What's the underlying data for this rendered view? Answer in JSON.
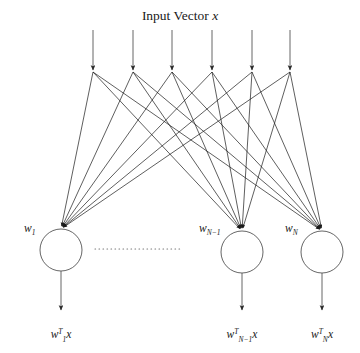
{
  "figure": {
    "title_prefix": "Input Vector ",
    "title_var": "x",
    "width": 360,
    "height": 353,
    "background": "#ffffff",
    "ink_color": "#1a1a1a",
    "line_color": "#555555",
    "dot_color": "#777777"
  },
  "inputs": {
    "count": 6,
    "arrow_x": [
      93,
      133,
      172,
      212,
      252,
      290
    ],
    "arrow_top_y": 30,
    "arrow_tip_y": 70
  },
  "neurons": [
    {
      "id": "neuron-1",
      "weight_label_base": "w",
      "weight_label_sub": "1",
      "output_label_base": "w",
      "output_label_sub": "1",
      "output_label_sup": "T",
      "output_label_var": "x",
      "cx": 61,
      "cy": 250,
      "r": 21
    },
    {
      "id": "neuron-n-minus-1",
      "weight_label_base": "w",
      "weight_label_sub": "N−1",
      "output_label_base": "w",
      "output_label_sub": "N−1",
      "output_label_sup": "T",
      "output_label_var": "x",
      "cx": 242,
      "cy": 252,
      "r": 21
    },
    {
      "id": "neuron-n",
      "weight_label_base": "w",
      "weight_label_sub": "N",
      "output_label_base": "w",
      "output_label_sub": "N",
      "output_label_sup": "T",
      "output_label_var": "x",
      "cx": 322,
      "cy": 252,
      "r": 21
    }
  ],
  "ellipsis": {
    "x_start": 95,
    "x_end": 180,
    "y": 249
  },
  "outputs": {
    "arrow_bottom_y": 310,
    "label_y": 338
  }
}
